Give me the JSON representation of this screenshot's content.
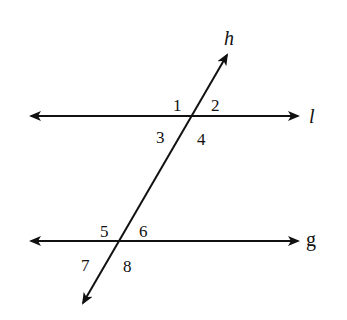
{
  "diagram": {
    "colors": {
      "stroke": "#111111",
      "background": "#ffffff"
    },
    "lines": {
      "l": {
        "label": "l",
        "style": "italic",
        "x1": 31,
        "y1": 116,
        "x2": 298,
        "y2": 116
      },
      "g": {
        "label": "g",
        "style": "normal",
        "x1": 31,
        "y1": 241,
        "x2": 298,
        "y2": 241
      },
      "h": {
        "label": "h",
        "style": "italic",
        "x1": 83,
        "y1": 303,
        "x2": 227,
        "y2": 55
      }
    },
    "intersections": [
      {
        "name": "h-l",
        "x": 192,
        "y": 116
      },
      {
        "name": "h-g",
        "x": 120,
        "y": 241
      }
    ],
    "angle_labels": [
      "1",
      "2",
      "3",
      "4",
      "5",
      "6",
      "7",
      "8"
    ]
  }
}
